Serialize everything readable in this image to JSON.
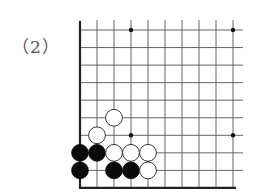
{
  "problem_label": "（2）",
  "board": {
    "view": "lower-left corner, partial board",
    "columns_visible": 10,
    "rows_visible": 9,
    "origin": {
      "x": 80,
      "y": 30
    },
    "spacing_x": 17,
    "spacing_y": 17.55,
    "line_color": "#555555",
    "edge_color": "#222222",
    "star_points": [
      {
        "col": 3,
        "row": 0
      },
      {
        "col": 9,
        "row": 0
      },
      {
        "col": 3,
        "row": 6
      },
      {
        "col": 9,
        "row": 6
      }
    ],
    "stones": [
      {
        "color": "white",
        "col": 2,
        "row": 5
      },
      {
        "color": "white",
        "col": 1,
        "row": 6
      },
      {
        "color": "black",
        "col": 0,
        "row": 7
      },
      {
        "color": "black",
        "col": 1,
        "row": 7
      },
      {
        "color": "white",
        "col": 2,
        "row": 7
      },
      {
        "color": "white",
        "col": 3,
        "row": 7
      },
      {
        "color": "white",
        "col": 4,
        "row": 7
      },
      {
        "color": "black",
        "col": 0,
        "row": 8
      },
      {
        "color": "black",
        "col": 2,
        "row": 8
      },
      {
        "color": "black",
        "col": 3,
        "row": 8
      },
      {
        "color": "white",
        "col": 4,
        "row": 8
      }
    ]
  }
}
